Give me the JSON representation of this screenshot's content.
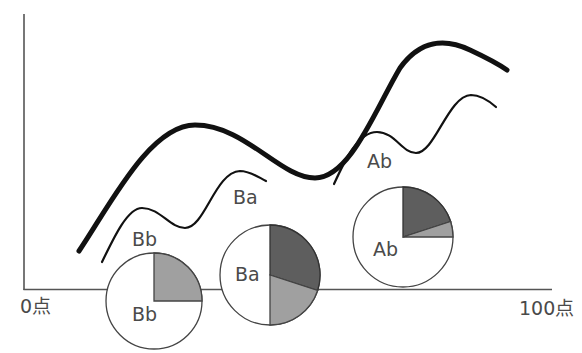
{
  "axes": {
    "x_min_label": "0点",
    "x_max_label": "100点"
  },
  "curves": [
    {
      "name": "overall",
      "style": "thick"
    },
    {
      "name": "B-group",
      "style": "thin",
      "labels": [
        "Bb",
        "Ba"
      ]
    },
    {
      "name": "A-group",
      "style": "thin",
      "labels": [
        "Ab"
      ]
    }
  ],
  "curve_labels": {
    "bb": "Bb",
    "ba": "Ba",
    "ab": "Ab"
  },
  "pies": [
    {
      "label": "Bb",
      "slices": [
        {
          "name": "dark",
          "fraction": 0.0,
          "color": "#5e5e5e"
        },
        {
          "name": "medium",
          "fraction": 0.25,
          "color": "#a0a0a0"
        },
        {
          "name": "white",
          "fraction": 0.75,
          "color": "#ffffff"
        }
      ]
    },
    {
      "label": "Ba",
      "slices": [
        {
          "name": "dark",
          "fraction": 0.3,
          "color": "#5e5e5e"
        },
        {
          "name": "medium",
          "fraction": 0.2,
          "color": "#a0a0a0"
        },
        {
          "name": "white",
          "fraction": 0.5,
          "color": "#ffffff"
        }
      ]
    },
    {
      "label": "Ab",
      "slices": [
        {
          "name": "dark",
          "fraction": 0.2,
          "color": "#5e5e5e"
        },
        {
          "name": "medium",
          "fraction": 0.05,
          "color": "#a0a0a0"
        },
        {
          "name": "white",
          "fraction": 0.75,
          "color": "#ffffff"
        }
      ]
    }
  ]
}
